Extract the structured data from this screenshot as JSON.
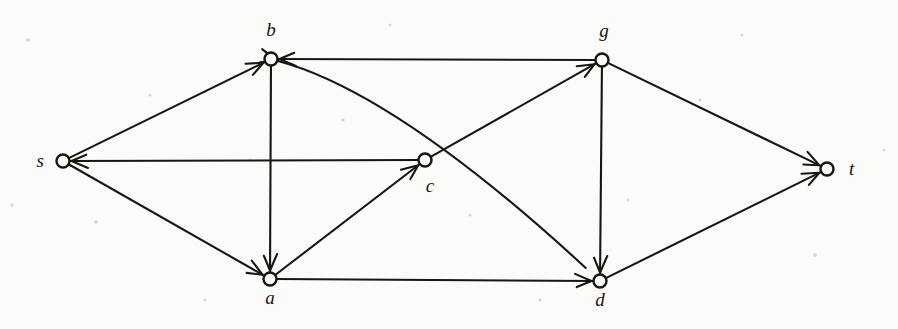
{
  "figure": {
    "kind": "directed-graph-diagram",
    "width": 898,
    "height": 329,
    "background_color": "#fbfbf9",
    "ink_color": "#19160f",
    "node_radius": 6.5
  },
  "nodes": [
    {
      "id": "s",
      "label": "s",
      "x": 63,
      "y": 161,
      "label_x": 44,
      "label_y": 167
    },
    {
      "id": "b",
      "label": "b",
      "x": 271,
      "y": 59,
      "label_x": 271,
      "label_y": 36
    },
    {
      "id": "c",
      "label": "c",
      "x": 425,
      "y": 160,
      "label_x": 430,
      "label_y": 192
    },
    {
      "id": "a",
      "label": "a",
      "x": 270,
      "y": 279,
      "label_x": 270,
      "label_y": 304
    },
    {
      "id": "g",
      "label": "g",
      "x": 602,
      "y": 60,
      "label_x": 604,
      "label_y": 37
    },
    {
      "id": "d",
      "label": "d",
      "x": 600,
      "y": 281,
      "label_x": 600,
      "label_y": 306
    },
    {
      "id": "t",
      "label": "t",
      "x": 827,
      "y": 169,
      "label_x": 849,
      "label_y": 175
    }
  ],
  "edges": [
    {
      "id": "s-b",
      "from": "s",
      "to": "b",
      "shape": "straight",
      "arrow_at": "b"
    },
    {
      "id": "s-a",
      "from": "s",
      "to": "a",
      "shape": "straight",
      "arrow_at": "a"
    },
    {
      "id": "c-s",
      "from": "c",
      "to": "s",
      "shape": "straight",
      "arrow_at": "s"
    },
    {
      "id": "b-a",
      "from": "b",
      "to": "a",
      "shape": "straight",
      "arrow_at": "a"
    },
    {
      "id": "g-b",
      "from": "g",
      "to": "b",
      "shape": "straight",
      "arrow_at": "b"
    },
    {
      "id": "d-b",
      "from": "d",
      "to": "b",
      "shape": "curved",
      "arrow_at": "b"
    },
    {
      "id": "a-c",
      "from": "a",
      "to": "c",
      "shape": "straight",
      "arrow_at": "c"
    },
    {
      "id": "c-g",
      "from": "c",
      "to": "g",
      "shape": "straight",
      "arrow_at": "g"
    },
    {
      "id": "a-d",
      "from": "a",
      "to": "d",
      "shape": "straight",
      "arrow_at": "d"
    },
    {
      "id": "g-d",
      "from": "g",
      "to": "d",
      "shape": "straight",
      "arrow_at": "d"
    },
    {
      "id": "g-t",
      "from": "g",
      "to": "t",
      "shape": "straight",
      "arrow_at": "t"
    },
    {
      "id": "d-t",
      "from": "d",
      "to": "t",
      "shape": "straight",
      "arrow_at": "t"
    }
  ]
}
